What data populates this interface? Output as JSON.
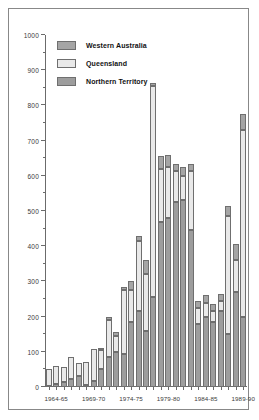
{
  "chart_data": {
    "type": "bar",
    "subtype": "stacked-bar",
    "title": "",
    "xlabel": "",
    "ylabel": "",
    "ylim": [
      0,
      1000
    ],
    "ytick_step": 100,
    "yminor_step": 50,
    "grid": false,
    "legend_position": "top-left",
    "categories": [
      "1963-64",
      "1964-65",
      "1965-66",
      "1966-67",
      "1967-68",
      "1968-69",
      "1969-70",
      "1970-71",
      "1971-72",
      "1972-73",
      "1973-74",
      "1974-75",
      "1975-76",
      "1976-77",
      "1977-78",
      "1978-79",
      "1979-80",
      "1980-81",
      "1981-82",
      "1982-83",
      "1983-84",
      "1984-85",
      "1985-86",
      "1986-87",
      "1987-88",
      "1988-89",
      "1989-90"
    ],
    "ytick_labels": [
      "0",
      "100",
      "200",
      "300",
      "400",
      "500",
      "600",
      "700",
      "800",
      "900",
      "1000"
    ],
    "xtick_labels": [
      "1964-65",
      "1969-70",
      "1974-75",
      "1979-80",
      "1984-85",
      "1989-90"
    ],
    "xtick_label_indices": [
      1,
      6,
      11,
      16,
      21,
      26
    ],
    "series": [
      {
        "name": "Northern Territory",
        "color": "#9d9d9d",
        "values": [
          3,
          8,
          14,
          22,
          30,
          6,
          16,
          50,
          85,
          100,
          95,
          185,
          215,
          160,
          255,
          470,
          480,
          525,
          530,
          445,
          180,
          200,
          185,
          215,
          150,
          270,
          200
        ]
      },
      {
        "name": "Queensland",
        "color": "#e9e9e9",
        "values": [
          47,
          52,
          44,
          63,
          38,
          65,
          93,
          55,
          105,
          45,
          180,
          90,
          200,
          160,
          600,
          150,
          145,
          90,
          70,
          170,
          45,
          40,
          30,
          30,
          335,
          90,
          530
        ]
      },
      {
        "name": "Western Australia",
        "color": "#a5a5a5",
        "values": [
          0,
          0,
          0,
          0,
          0,
          0,
          0,
          4,
          8,
          10,
          10,
          25,
          15,
          40,
          8,
          35,
          35,
          20,
          25,
          20,
          18,
          22,
          20,
          18,
          30,
          45,
          45
        ]
      }
    ],
    "totals": [
      50,
      60,
      58,
      85,
      68,
      71,
      109,
      109,
      198,
      155,
      285,
      300,
      430,
      360,
      863,
      655,
      660,
      635,
      625,
      635,
      243,
      262,
      235,
      263,
      515,
      405,
      775
    ]
  },
  "legend": {
    "items": [
      {
        "label": "Western Australia",
        "color": "#a5a5a5"
      },
      {
        "label": "Queensland",
        "color": "#e9e9e9"
      },
      {
        "label": "Northern Territory",
        "color": "#9d9d9d"
      }
    ]
  }
}
